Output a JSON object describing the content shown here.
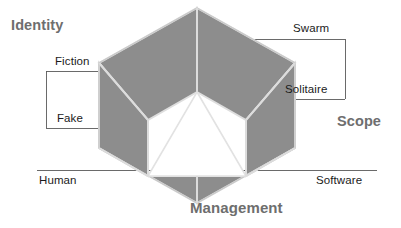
{
  "diagram": {
    "shape": "hexagon-of-six-rhombi-around-central-triangle",
    "colors": {
      "background": "#ffffff",
      "rhombus_fill": "#8d8d8d",
      "rhombus_edge": "#d8d8d8",
      "center_triangle_fill": "#ffffff",
      "axis_label_color": "#6e6e6e",
      "node_label_color": "#1b1b1b",
      "leader_line_color": "#5a5a5a"
    },
    "axes": [
      {
        "id": "identity",
        "label": "Identity",
        "position": "top-left"
      },
      {
        "id": "scope",
        "label": "Scope",
        "position": "right"
      },
      {
        "id": "management",
        "label": "Management",
        "position": "bottom-center"
      }
    ],
    "nodes": [
      {
        "id": "fiction",
        "label": "Fiction",
        "axis": "identity",
        "side": "left",
        "position": "upper-left"
      },
      {
        "id": "fake",
        "label": "Fake",
        "axis": "identity",
        "side": "left",
        "position": "mid-left"
      },
      {
        "id": "swarm",
        "label": "Swarm",
        "axis": "scope",
        "side": "right",
        "position": "upper-right"
      },
      {
        "id": "solitaire",
        "label": "Solitaire",
        "axis": "scope",
        "side": "right",
        "position": "mid-right"
      },
      {
        "id": "human",
        "label": "Human",
        "axis": "management",
        "side": "left",
        "position": "lower-left"
      },
      {
        "id": "software",
        "label": "Software",
        "axis": "management",
        "side": "right",
        "position": "lower-right"
      }
    ]
  }
}
